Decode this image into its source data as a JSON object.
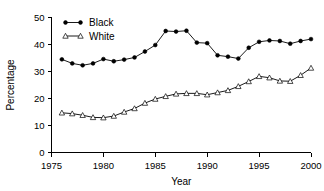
{
  "chart_data": {
    "type": "line",
    "title": "",
    "xlabel": "Year",
    "ylabel": "Percentage",
    "xlim": [
      1975,
      2000
    ],
    "ylim": [
      0,
      50
    ],
    "xticks": [
      1975,
      1980,
      1985,
      1990,
      1995,
      2000
    ],
    "yticks": [
      0,
      10,
      20,
      30,
      40,
      50
    ],
    "grid": false,
    "legend_position": "top-left",
    "x": [
      1976,
      1977,
      1978,
      1979,
      1980,
      1981,
      1982,
      1983,
      1984,
      1985,
      1986,
      1987,
      1988,
      1989,
      1990,
      1991,
      1992,
      1993,
      1994,
      1995,
      1996,
      1997,
      1998,
      1999,
      2000
    ],
    "series": [
      {
        "name": "Black",
        "marker": "filled-circle",
        "color": "#000000",
        "values": [
          34.5,
          33.0,
          32.3,
          33.0,
          34.6,
          33.8,
          34.4,
          35.2,
          37.4,
          39.8,
          45.0,
          44.8,
          45.1,
          40.7,
          40.5,
          36.0,
          35.5,
          34.8,
          38.8,
          41.0,
          41.5,
          41.3,
          40.3,
          41.3,
          42.0
        ]
      },
      {
        "name": "White",
        "marker": "open-triangle",
        "color": "#000000",
        "values": [
          14.7,
          14.4,
          13.8,
          13.0,
          12.9,
          13.5,
          15.0,
          16.3,
          18.3,
          19.8,
          20.8,
          21.7,
          21.9,
          21.9,
          21.4,
          22.2,
          23.0,
          24.5,
          26.3,
          28.2,
          27.7,
          26.5,
          26.4,
          28.6,
          31.3
        ]
      }
    ],
    "legend": [
      {
        "label": "Black",
        "marker": "filled-circle"
      },
      {
        "label": "White",
        "marker": "open-triangle"
      }
    ]
  }
}
